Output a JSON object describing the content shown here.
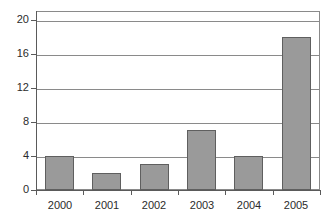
{
  "chart_data": {
    "type": "bar",
    "title": "",
    "subtitle": "",
    "xlabel": "",
    "ylabel": "",
    "categories": [
      "2000",
      "2001",
      "2002",
      "2003",
      "2004",
      "2005"
    ],
    "values": [
      4,
      2,
      3,
      7,
      4,
      18
    ],
    "ylim": [
      0,
      21
    ],
    "xlim": [
      0,
      6
    ],
    "y_ticks": [
      0,
      4,
      8,
      12,
      16,
      20
    ],
    "y_tick_labels": [
      "0",
      "4",
      "8",
      "12",
      "16",
      "20"
    ],
    "grid": true,
    "grid_axis": "y",
    "legend": false,
    "legend_position": "none",
    "annotations": [],
    "bar_fill_color": "#9a9a9a",
    "bar_edge_color": "#5f5f5f",
    "grid_color": "#8a8a8a",
    "axis_color": "#5a5a5a",
    "text_color": "#2b2b2b",
    "background_color": "#ffffff"
  }
}
